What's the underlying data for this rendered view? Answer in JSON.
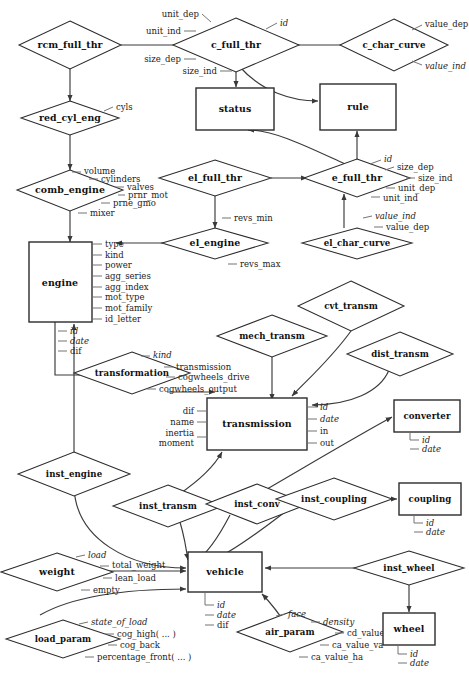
{
  "diagram": {
    "type": "entity-relationship",
    "colors": {
      "background": "#ffffff",
      "stroke": "#2b2b2b",
      "connector": "#3a3a3a",
      "attribute_tick": "#6d6d6d",
      "text": "#101010"
    }
  },
  "entities": [
    {
      "id": "status",
      "label": "status",
      "shape": "box"
    },
    {
      "id": "rule",
      "label": "rule",
      "shape": "box"
    },
    {
      "id": "engine",
      "label": "engine",
      "shape": "box"
    },
    {
      "id": "transmission",
      "label": "transmission",
      "shape": "box"
    },
    {
      "id": "converter",
      "label": "converter",
      "shape": "box"
    },
    {
      "id": "coupling",
      "label": "coupling",
      "shape": "box"
    },
    {
      "id": "vehicle",
      "label": "vehicle",
      "shape": "box"
    },
    {
      "id": "wheel",
      "label": "wheel",
      "shape": "box"
    }
  ],
  "relationships": [
    {
      "id": "rcm_full_thr",
      "label": "rcm_full_thr",
      "shape": "diamond"
    },
    {
      "id": "c_full_thr",
      "label": "c_full_thr",
      "shape": "diamond"
    },
    {
      "id": "c_char_curve",
      "label": "c_char_curve",
      "shape": "diamond"
    },
    {
      "id": "red_cyl_eng",
      "label": "red_cyl_eng",
      "shape": "diamond"
    },
    {
      "id": "comb_engine",
      "label": "comb_engine",
      "shape": "diamond"
    },
    {
      "id": "el_full_thr",
      "label": "el_full_thr",
      "shape": "diamond"
    },
    {
      "id": "e_full_thr",
      "label": "e_full_thr",
      "shape": "diamond"
    },
    {
      "id": "el_engine",
      "label": "el_engine",
      "shape": "diamond"
    },
    {
      "id": "el_char_curve",
      "label": "el_char_curve",
      "shape": "diamond"
    },
    {
      "id": "transformation",
      "label": "transformation",
      "shape": "diamond"
    },
    {
      "id": "mech_transm",
      "label": "mech_transm",
      "shape": "diamond"
    },
    {
      "id": "cvt_transm",
      "label": "cvt_transm",
      "shape": "diamond"
    },
    {
      "id": "dist_transm",
      "label": "dist_transm",
      "shape": "diamond"
    },
    {
      "id": "inst_engine",
      "label": "inst_engine",
      "shape": "diamond"
    },
    {
      "id": "inst_transm",
      "label": "inst_transm",
      "shape": "diamond"
    },
    {
      "id": "inst_conv",
      "label": "inst_conv",
      "shape": "diamond"
    },
    {
      "id": "inst_coupling",
      "label": "inst_coupling",
      "shape": "diamond"
    },
    {
      "id": "inst_wheel",
      "label": "inst_wheel",
      "shape": "diamond"
    },
    {
      "id": "weight",
      "label": "weight",
      "shape": "diamond"
    },
    {
      "id": "load_param",
      "label": "load_param",
      "shape": "diamond"
    },
    {
      "id": "air_param",
      "label": "air_param",
      "shape": "diamond"
    }
  ],
  "attributes": {
    "c_full_thr": [
      "unit_dep",
      "unit_ind",
      "size_dep",
      "size_ind",
      "id"
    ],
    "c_char_curve": [
      "value_dep",
      "value_ind"
    ],
    "red_cyl_eng": [
      "cyls"
    ],
    "comb_engine": [
      "volume",
      "cylinders",
      "valves",
      "prnr_mot",
      "prne_gmo",
      "mixer"
    ],
    "e_full_thr": [
      "id",
      "size_dep",
      "size_ind",
      "unit_dep",
      "unit_ind"
    ],
    "el_char_curve": [
      "value_ind",
      "value_dep"
    ],
    "el_engine": [
      "revs_min",
      "revs_max"
    ],
    "engine": [
      "type",
      "kind",
      "power",
      "agg_series",
      "agg_index",
      "mot_type",
      "mot_family",
      "id_letter",
      "id",
      "date",
      "dif"
    ],
    "transformation": [
      "kind",
      "transmission",
      "cogwheels_drive",
      "cogwheels_output"
    ],
    "transmission": [
      "dif",
      "name",
      "inertia",
      "moment",
      "id",
      "date",
      "in",
      "out"
    ],
    "converter": [
      "id",
      "date"
    ],
    "coupling": [
      "id",
      "date"
    ],
    "vehicle": [
      "id",
      "date",
      "dif"
    ],
    "wheel": [
      "id",
      "date"
    ],
    "weight": [
      "load",
      "total_weight",
      "lean_load",
      "empty"
    ],
    "load_param": [
      "state_of_load",
      "cog_high( ... )",
      "cog_back",
      "percentage_front( ... )"
    ],
    "air_param": [
      "face",
      "density",
      "cd_value",
      "ca_value_va",
      "ca_value_ha"
    ]
  },
  "labels": {
    "rcm_full_thr": "rcm_full_thr",
    "c_full_thr": "c_full_thr",
    "c_char_curve": "c_char_curve",
    "red_cyl_eng": "red_cyl_eng",
    "comb_engine": "comb_engine",
    "el_full_thr": "el_full_thr",
    "e_full_thr": "e_full_thr",
    "el_engine": "el_engine",
    "el_char_curve": "el_char_curve",
    "engine": "engine",
    "status": "status",
    "rule": "rule",
    "transformation": "transformation",
    "mech_transm": "mech_transm",
    "cvt_transm": "cvt_transm",
    "dist_transm": "dist_transm",
    "transmission": "transmission",
    "converter": "converter",
    "coupling": "coupling",
    "inst_engine": "inst_engine",
    "inst_transm": "inst_transm",
    "inst_conv": "inst_conv",
    "inst_coupling": "inst_coupling",
    "inst_wheel": "inst_wheel",
    "weight": "weight",
    "load_param": "load_param",
    "vehicle": "vehicle",
    "air_param": "air_param",
    "wheel": "wheel"
  },
  "attr_text": {
    "unit_dep": "unit_dep",
    "unit_ind": "unit_ind",
    "size_dep": "size_dep",
    "size_ind": "size_ind",
    "id": "id",
    "value_dep": "value_dep",
    "value_ind": "value_ind",
    "cyls": "cyls",
    "volume": "volume",
    "cylinders": "cylinders",
    "valves": "valves",
    "prnr_mot": "prnr_mot",
    "prne_gmo": "prne_gmo",
    "mixer": "mixer",
    "revs_min": "revs_min",
    "revs_max": "revs_max",
    "e_id": "id",
    "e_size_dep": "size_dep",
    "e_size_ind": "size_ind",
    "e_unit_dep": "unit_dep",
    "e_unit_ind": "unit_ind",
    "ec_value_ind": "value_ind",
    "ec_value_dep": "value_dep",
    "type": "type",
    "kind": "kind",
    "power": "power",
    "agg_series": "agg_series",
    "agg_index": "agg_index",
    "mot_type": "mot_type",
    "mot_family": "mot_family",
    "id_letter": "id_letter",
    "eng_id": "id",
    "eng_date": "date",
    "eng_dif": "dif",
    "tr_kind": "kind",
    "tr_transmission": "transmission",
    "tr_cogwheels_drive": "cogwheels_drive",
    "tr_cogwheels_output": "cogwheels_output",
    "tm_dif": "dif",
    "tm_name": "name",
    "tm_inertia": "inertia",
    "tm_moment": "moment",
    "tm_id": "id",
    "tm_date": "date",
    "tm_in": "in",
    "tm_out": "out",
    "cv_id": "id",
    "cv_date": "date",
    "cp_id": "id",
    "cp_date": "date",
    "vh_id": "id",
    "vh_date": "date",
    "vh_dif": "dif",
    "wh_id": "id",
    "wh_date": "date",
    "w_load": "load",
    "w_total_weight": "total_weight",
    "w_lean_load": "lean_load",
    "w_empty": "empty",
    "lp_state_of_load": "state_of_load",
    "lp_cog_high": "cog_high( ... )",
    "lp_cog_back": "cog_back",
    "lp_percentage_front": "percentage_front( ... )",
    "ap_face": "face",
    "ap_density": "density",
    "ap_cd_value": "cd_value",
    "ap_ca_value_va": "ca_value_va",
    "ap_ca_value_ha": "ca_value_ha"
  }
}
